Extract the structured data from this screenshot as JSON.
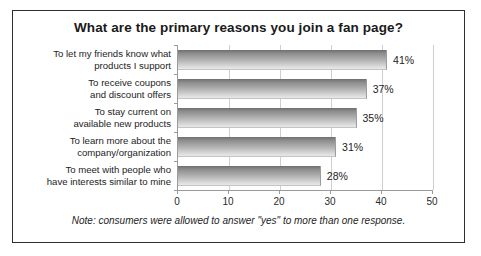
{
  "chart_data": {
    "type": "bar",
    "orientation": "horizontal",
    "title": "What are the primary reasons you join a fan page?",
    "categories": [
      "To let my friends know what products I support",
      "To receive coupons and discount offers",
      "To stay current on available new products",
      "To learn more about the company/organization",
      "To meet with people who have interests similar to mine"
    ],
    "category_lines": [
      [
        "To let my friends know what",
        "products I support"
      ],
      [
        "To receive coupons",
        "and discount offers"
      ],
      [
        "To stay current on",
        "available new products"
      ],
      [
        "To learn more about the",
        "company/organization"
      ],
      [
        "To meet with people who",
        "have interests similar to mine"
      ]
    ],
    "values": [
      41,
      37,
      35,
      31,
      28
    ],
    "value_labels": [
      "41%",
      "37%",
      "35%",
      "31%",
      "28%"
    ],
    "xlabel": "",
    "ylabel": "",
    "xlim": [
      0,
      50
    ],
    "xticks": [
      0,
      10,
      20,
      30,
      40,
      50
    ],
    "xtick_labels": [
      "0",
      "10",
      "20",
      "30",
      "40",
      "50"
    ],
    "grid": true,
    "legend": false,
    "bar_color_top": "#6f6f6f",
    "bar_color_bottom": "#e8e8e8"
  },
  "footnote": "Note: consumers were allowed to answer \"yes\" to more than one response."
}
